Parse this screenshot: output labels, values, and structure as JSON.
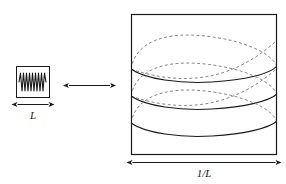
{
  "figure": {
    "type": "physics-duality-diagram",
    "background_color": "#ffffff",
    "stroke_color": "#1a1a1a",
    "dashed_stroke_color": "#7a7a7a"
  },
  "small_box": {
    "name": "small-box",
    "label": "L",
    "wave": {
      "name": "short-wavelength-wave",
      "oscillation_count": 5,
      "style": "solid"
    },
    "dimension_arrow": {
      "name": "small-box-width-arrow",
      "label": "L",
      "heads": "both"
    }
  },
  "relation_arrow": {
    "name": "duality-arrow",
    "label": "",
    "heads": "both"
  },
  "large_box": {
    "name": "large-box",
    "label": "1/L",
    "waves": {
      "name": "long-wavelength-helical-modes",
      "solid_arc_count": 3,
      "dashed_arc_count": 3,
      "style": "solid front arcs with dashed back arcs"
    },
    "dimension_arrow": {
      "name": "large-box-width-arrow",
      "label": "1/L",
      "heads": "both"
    }
  }
}
